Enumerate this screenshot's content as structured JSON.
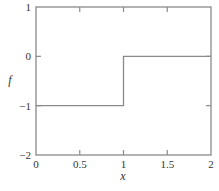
{
  "chart_data": {
    "type": "line",
    "title": "",
    "xlabel": "x",
    "ylabel": "f",
    "xlim": [
      0,
      2
    ],
    "ylim": [
      -2,
      1
    ],
    "grid": false,
    "legend": null,
    "xticks": [
      0,
      0.5,
      1,
      1.5,
      2
    ],
    "xtick_labels": [
      "0",
      "0.5",
      "1",
      "1.5",
      "2"
    ],
    "yticks": [
      -2,
      -1,
      0,
      1
    ],
    "ytick_labels": [
      "−2",
      "−1",
      "0",
      "1"
    ],
    "series": [
      {
        "name": "f(x)",
        "style": "step",
        "x": [
          0,
          1,
          1,
          2
        ],
        "y": [
          -1,
          -1,
          0,
          0
        ]
      }
    ]
  },
  "colors": {
    "line": "#8a8a8a",
    "axis": "#8a8a8a",
    "text": "#333333"
  }
}
